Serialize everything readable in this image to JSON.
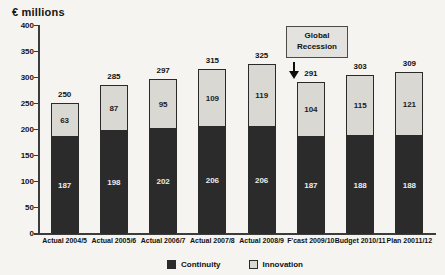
{
  "chart_data": {
    "type": "bar",
    "stacked": true,
    "title": "€ millions",
    "categories": [
      "Actual 2004/5",
      "Actual 2005/6",
      "Actual 2006/7",
      "Actual 2007/8",
      "Actual 2008/9",
      "F'cast 2009/10",
      "Budget 2010/11",
      "Plan 20011/12"
    ],
    "series": [
      {
        "name": "Continuity",
        "color": "#2b2b2b",
        "label_color": "#ececec",
        "values": [
          187,
          198,
          202,
          206,
          206,
          187,
          188,
          188
        ]
      },
      {
        "name": "Innovation",
        "color": "#d9d8d3",
        "label_color": "#1c1c1c",
        "values": [
          63,
          87,
          95,
          109,
          119,
          104,
          115,
          121
        ]
      }
    ],
    "totals": [
      250,
      285,
      297,
      315,
      325,
      291,
      303,
      309
    ],
    "ylabel": "€ millions",
    "ylim": [
      0,
      400
    ],
    "yticks": [
      0,
      50,
      100,
      150,
      200,
      250,
      300,
      350,
      400
    ],
    "grid": false,
    "legend_position": "bottom",
    "annotation": {
      "text": "Global Recession",
      "target_category": "F'cast 2009/10"
    }
  },
  "colors": {
    "background": "#f5f4f0",
    "axis": "#3c3c3c",
    "continuity": "#2b2b2b",
    "innovation": "#d9d8d3",
    "annotation_fill": "#e3e2de",
    "annotation_border": "#4a4a4a"
  }
}
